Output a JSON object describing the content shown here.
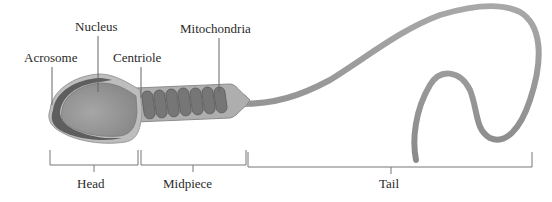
{
  "diagram": {
    "structure_labels": [
      {
        "id": "acrosome",
        "text": "Acrosome"
      },
      {
        "id": "nucleus",
        "text": "Nucleus"
      },
      {
        "id": "centriole",
        "text": "Centriole"
      },
      {
        "id": "mitochondria",
        "text": "Mitochondria"
      }
    ],
    "region_labels": [
      {
        "id": "head",
        "text": "Head"
      },
      {
        "id": "midpiece",
        "text": "Midpiece"
      },
      {
        "id": "tail",
        "text": "Tail"
      }
    ],
    "colors": {
      "body_fill": "#9a9a9a",
      "head_outer": "#b4b4b4",
      "head_inner": "#8e8e8e",
      "acrosome_band": "#5e5e5e",
      "mito_fill": "#7a7a7a",
      "line": "#555555",
      "text": "#2a2a2a"
    }
  }
}
